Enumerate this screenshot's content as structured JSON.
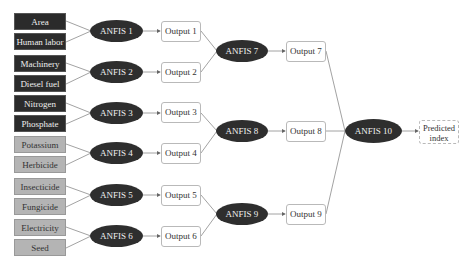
{
  "inputs": [
    {
      "label": "Area",
      "style": "dark"
    },
    {
      "label": "Human labor",
      "style": "dark"
    },
    {
      "label": "Machinery",
      "style": "dark"
    },
    {
      "label": "Diesel fuel",
      "style": "dark"
    },
    {
      "label": "Nitrogen",
      "style": "dark"
    },
    {
      "label": "Phosphate",
      "style": "dark"
    },
    {
      "label": "Potassium",
      "style": "light"
    },
    {
      "label": "Herbicide",
      "style": "light"
    },
    {
      "label": "Insecticide",
      "style": "light"
    },
    {
      "label": "Fungicide",
      "style": "light"
    },
    {
      "label": "Electricity",
      "style": "light"
    },
    {
      "label": "Seed",
      "style": "light"
    }
  ],
  "layer1": {
    "anfis": [
      "ANFIS 1",
      "ANFIS 2",
      "ANFIS 3",
      "ANFIS 4",
      "ANFIS 5",
      "ANFIS 6"
    ],
    "outputs": [
      "Output 1",
      "Output 2",
      "Output 3",
      "Output 4",
      "Output 5",
      "Output 6"
    ]
  },
  "layer2": {
    "anfis": [
      "ANFIS 7",
      "ANFIS 8",
      "ANFIS 9"
    ],
    "outputs": [
      "Output 7",
      "Output 8",
      "Output 9"
    ]
  },
  "layer3": {
    "anfis": "ANFIS 10",
    "result_line1": "Predicted",
    "result_line2": "index"
  },
  "colors": {
    "dark_node": "#2e2e2e",
    "dark_input": "#2b2b2b",
    "light_input": "#b4b4b4",
    "connector": "#8a8a8a"
  }
}
